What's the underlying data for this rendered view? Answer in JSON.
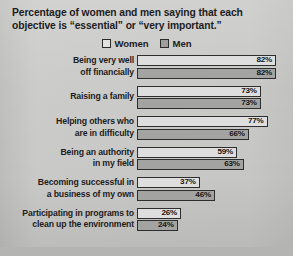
{
  "title": {
    "line1": "Percentage of women and men saying that each",
    "line2": "objective is “essential” or “very important.”"
  },
  "legend": {
    "items": [
      {
        "label": "Women",
        "color": "#e3e3e1"
      },
      {
        "label": "Men",
        "color": "#9e9e9c"
      }
    ]
  },
  "chart_data": {
    "type": "bar",
    "orientation": "horizontal",
    "title": "Percentage of women and men saying that each objective is “essential” or “very important.”",
    "xlabel": "",
    "ylabel": "",
    "xlim": [
      0,
      100
    ],
    "grid": false,
    "legend_position": "top-center",
    "value_suffix": "%",
    "categories": [
      "Being very well off financially",
      "Raising a family",
      "Helping others who are in difficulty",
      "Being an authority in my field",
      "Becoming successful in a business of my own",
      "Participating in programs to clean up the environment"
    ],
    "category_lines": [
      [
        "Being very well",
        "off financially"
      ],
      [
        "Raising a family",
        ""
      ],
      [
        "Helping others who",
        "are in difficulty"
      ],
      [
        "Being an authority",
        "in my field"
      ],
      [
        "Becoming successful in",
        "a business of my own"
      ],
      [
        "Participating in programs to",
        "clean up the environment"
      ]
    ],
    "series": [
      {
        "name": "Women",
        "values": [
          82,
          73,
          77,
          59,
          37,
          26
        ],
        "labels": [
          "82%",
          "73%",
          "77%",
          "59%",
          "37%",
          "26%"
        ]
      },
      {
        "name": "Men",
        "values": [
          82,
          73,
          66,
          63,
          46,
          24
        ],
        "labels": [
          "82%",
          "73%",
          "66%",
          "63%",
          "46%",
          "24%"
        ]
      }
    ]
  }
}
